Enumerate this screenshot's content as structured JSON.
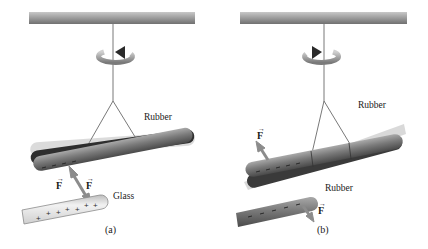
{
  "panels": [
    {
      "id": "a",
      "caption": "(a)",
      "rotation_direction": "counterclockwise",
      "suspended_rod": {
        "material_label": "Rubber",
        "charge": "-"
      },
      "nearby_rod": {
        "material_label": "Glass",
        "charge": "+"
      },
      "force_labels": [
        "F",
        "F"
      ],
      "interaction": "attraction"
    },
    {
      "id": "b",
      "caption": "(b)",
      "rotation_direction": "clockwise",
      "suspended_rod": {
        "material_label": "Rubber",
        "charge": "-"
      },
      "nearby_rod": {
        "material_label": "Rubber",
        "charge": "-"
      },
      "force_labels": [
        "F",
        "F"
      ],
      "interaction": "repulsion"
    }
  ],
  "colors": {
    "ceiling_bar": "#8a8a8a",
    "rubber_rod": "#6f6f6f",
    "glass_rod": "#e6e6e6",
    "force_arrow": "#8c8c8c",
    "rotation_arrow": "#9a9a9a"
  },
  "symbols": {
    "vector_arrow": "→"
  }
}
